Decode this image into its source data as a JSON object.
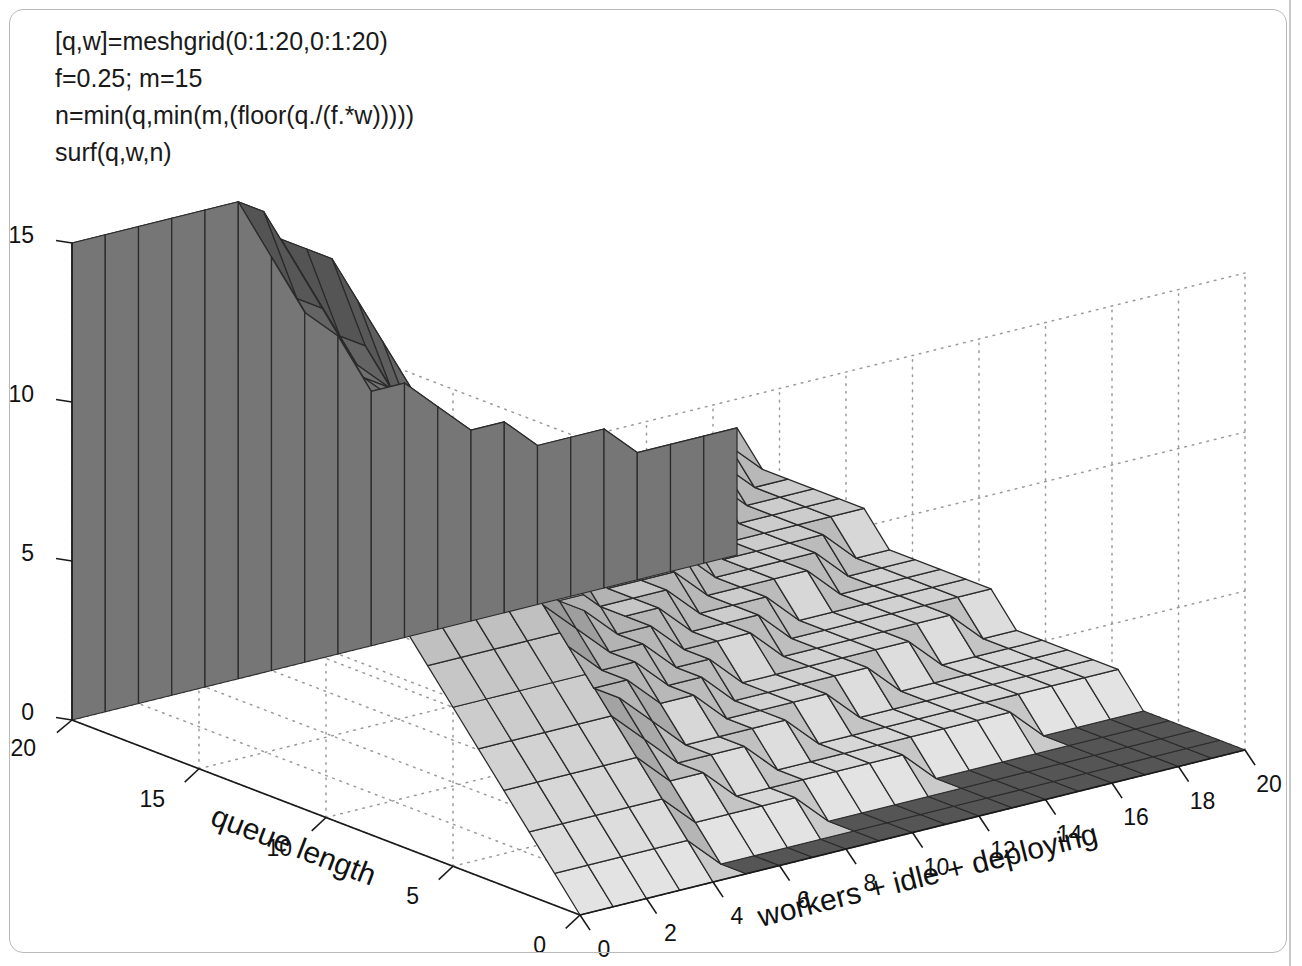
{
  "figure": {
    "type": "matlab-surface-plot",
    "background_color": "#ffffff",
    "frame_color": "#b9b9b9"
  },
  "annotation": {
    "name": "matlab-code-annotation",
    "lines": [
      "[q,w]=meshgrid(0:1:20,0:1:20)",
      "f=0.25; m=15",
      "n=min(q,min(m,(floor(q./(f.*w)))))",
      "surf(q,w,n)"
    ]
  },
  "chart_data": {
    "type": "surface",
    "title": "",
    "xlabel": "workers + idle + deploying",
    "ylabel": "queue length",
    "zlabel": "",
    "grid": true,
    "legend": null,
    "colormap": "gray",
    "formula": "n = min(q, min(m, floor(q ./ (f .* w))))",
    "parameters": {
      "f": 0.25,
      "m": 15,
      "q_range": [
        0,
        20
      ],
      "w_range": [
        0,
        20
      ],
      "step": 1
    },
    "x_axis": {
      "label": "workers + idle + deploying",
      "variable": "w",
      "range": [
        0,
        20
      ],
      "ticks": [
        20,
        18,
        16,
        14,
        12,
        10,
        8,
        6,
        4,
        2,
        0
      ],
      "tick_labels": [
        "20",
        "18",
        "16",
        "14",
        "12",
        "10",
        "8",
        "6",
        "4",
        "2",
        "0"
      ]
    },
    "y_axis": {
      "label": "queue length",
      "variable": "q",
      "range": [
        0,
        20
      ],
      "ticks": [
        20,
        15,
        10,
        5,
        0
      ],
      "tick_labels": [
        "20",
        "15",
        "10",
        "5",
        "0"
      ]
    },
    "z_axis": {
      "label": "",
      "variable": "n",
      "range": [
        0,
        15
      ],
      "ticks": [
        0,
        5,
        10,
        15
      ],
      "tick_labels": [
        "0",
        "5",
        "10",
        "15"
      ]
    }
  }
}
